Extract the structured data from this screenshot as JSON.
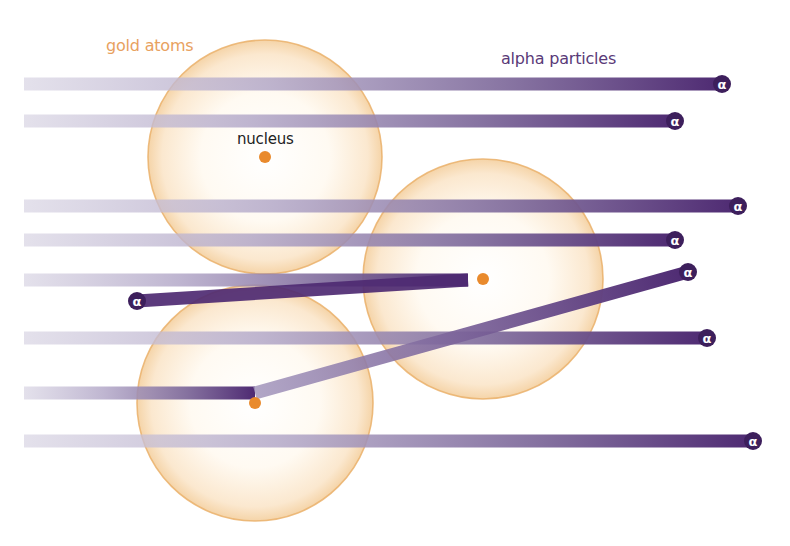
{
  "diagram": {
    "labels": {
      "gold_atoms": "gold atoms",
      "alpha_particles": "alpha particles",
      "nucleus": "nucleus"
    },
    "alpha_symbol": "α",
    "colors": {
      "background": "#ffffff",
      "atom_fill_center": "#fffdf9",
      "atom_fill_edge": "#f7dcb6",
      "atom_stroke": "#eab06a",
      "nucleus": "#e98a2c",
      "beam_faded": "#cfcadd",
      "beam_solid": "#4e2a72",
      "alpha_cap": "#3d1f5c",
      "gold_label": "#e8a160",
      "alpha_label": "#5a3a78",
      "nucleus_label": "#222222"
    },
    "atoms": [
      {
        "id": "atom-1",
        "cx": 265,
        "cy": 157,
        "r": 117,
        "nucleus": true,
        "nucleus_labeled": true
      },
      {
        "id": "atom-2",
        "cx": 483,
        "cy": 279,
        "r": 120,
        "nucleus": true,
        "nucleus_labeled": false
      },
      {
        "id": "atom-3",
        "cx": 255,
        "cy": 403,
        "r": 118,
        "nucleus": true,
        "nucleus_labeled": false
      }
    ],
    "beams": [
      {
        "id": "beam-1",
        "type": "straight",
        "y": 84,
        "x_end": 722
      },
      {
        "id": "beam-2",
        "type": "straight",
        "y": 121,
        "x_end": 675
      },
      {
        "id": "beam-3",
        "type": "straight",
        "y": 206,
        "x_end": 738
      },
      {
        "id": "beam-4",
        "type": "straight",
        "y": 240,
        "x_end": 675
      },
      {
        "id": "beam-5",
        "type": "reflected",
        "y": 280,
        "turn_x": 468,
        "end": [
          137,
          301
        ]
      },
      {
        "id": "beam-6",
        "type": "straight",
        "y": 338,
        "x_end": 707
      },
      {
        "id": "beam-7",
        "type": "deflected",
        "y": 393,
        "turn_x": 255,
        "end": [
          688,
          272
        ]
      },
      {
        "id": "beam-8",
        "type": "straight",
        "y": 441,
        "x_end": 753
      }
    ]
  }
}
